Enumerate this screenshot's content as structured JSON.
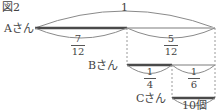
{
  "figure": {
    "title": "図2",
    "persons": {
      "a": "Aさん",
      "b": "Bさん",
      "c": "Cさん"
    },
    "whole_label": "1",
    "a_line": {
      "first": {
        "num": "7",
        "den": "12"
      },
      "second": {
        "num": "5",
        "den": "12"
      }
    },
    "b_line": {
      "first": {
        "num": "1",
        "den": "4"
      },
      "second": {
        "num": "1",
        "den": "6"
      }
    },
    "c_line": {
      "quantity": "10個"
    },
    "colors": {
      "dark_segment": "#4a4a4a",
      "light_segment": "#bdbdbd",
      "brace": "#8a8a8a",
      "dashed": "#9a9a9a"
    }
  }
}
